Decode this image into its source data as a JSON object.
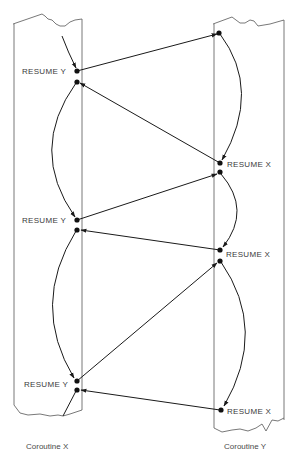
{
  "diagram": {
    "type": "coroutine-control-flow",
    "columns": [
      {
        "id": "x",
        "caption": "Coroutine X"
      },
      {
        "id": "y",
        "caption": "Coroutine Y"
      }
    ],
    "labels": {
      "x_resume_1": "RESUME  Y",
      "x_resume_2": "RESUME  Y",
      "x_resume_3": "RESUME  Y",
      "y_resume_1": "RESUME  X",
      "y_resume_2": "RESUME  X",
      "y_resume_3": "RESUME  X"
    },
    "transfers": [
      {
        "from": "Coroutine X",
        "at": "RESUME Y (1)",
        "to": "Coroutine Y",
        "target": "start"
      },
      {
        "from": "Coroutine Y",
        "at": "RESUME X (1)",
        "to": "Coroutine X",
        "target": "after RESUME Y (1)"
      },
      {
        "from": "Coroutine X",
        "at": "RESUME Y (2)",
        "to": "Coroutine Y",
        "target": "after RESUME X (1)"
      },
      {
        "from": "Coroutine Y",
        "at": "RESUME X (2)",
        "to": "Coroutine X",
        "target": "after RESUME Y (2)"
      },
      {
        "from": "Coroutine X",
        "at": "RESUME Y (3)",
        "to": "Coroutine Y",
        "target": "after RESUME X (2)"
      },
      {
        "from": "Coroutine Y",
        "at": "RESUME X (3)",
        "to": "Coroutine X",
        "target": "after RESUME Y (3)"
      }
    ],
    "colors": {
      "line": "#1a1a1a",
      "border": "#555555",
      "text": "#3a3a3a"
    }
  }
}
